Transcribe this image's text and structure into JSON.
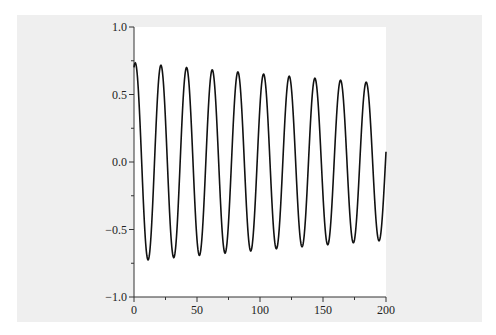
{
  "chart_data": {
    "type": "line",
    "title": "",
    "xlabel": "",
    "ylabel": "",
    "xlim": [
      0,
      200
    ],
    "ylim": [
      -1.0,
      1.0
    ],
    "grid": false,
    "legend": null,
    "x_ticks": [
      "0",
      "50",
      "100",
      "150",
      "200"
    ],
    "x_tick_values": [
      0,
      50,
      100,
      150,
      200
    ],
    "x_minor_ticks": [
      25,
      75,
      125,
      175
    ],
    "y_ticks": [
      "1.0",
      "0.5",
      "0.0",
      "−0.5",
      "−1.0"
    ],
    "y_tick_values": [
      1.0,
      0.5,
      0.0,
      -0.5,
      -1.0
    ],
    "y_minor_ticks": [
      0.75,
      0.25,
      -0.25,
      -0.75
    ],
    "series": [
      {
        "name": "damped oscillation",
        "color": "#111111",
        "model": {
          "amplitude": 0.735,
          "decay": 0.00118,
          "omega": 0.3085,
          "phase_shift": 1.0
        },
        "peaks": [
          {
            "x": 1,
            "y": 0.73
          },
          {
            "x": 21,
            "y": 0.73
          },
          {
            "x": 41,
            "y": 0.72
          },
          {
            "x": 62,
            "y": 0.71
          },
          {
            "x": 82,
            "y": 0.7
          },
          {
            "x": 102,
            "y": 0.68
          },
          {
            "x": 123,
            "y": 0.66
          },
          {
            "x": 143,
            "y": 0.64
          },
          {
            "x": 163,
            "y": 0.62
          },
          {
            "x": 184,
            "y": 0.61
          }
        ],
        "troughs": [
          {
            "x": 11,
            "y": -0.74
          },
          {
            "x": 31,
            "y": -0.72
          },
          {
            "x": 52,
            "y": -0.71
          },
          {
            "x": 72,
            "y": -0.7
          },
          {
            "x": 92,
            "y": -0.68
          },
          {
            "x": 112,
            "y": -0.66
          },
          {
            "x": 133,
            "y": -0.65
          },
          {
            "x": 153,
            "y": -0.63
          },
          {
            "x": 174,
            "y": -0.61
          },
          {
            "x": 194,
            "y": -0.58
          }
        ],
        "start": {
          "x": 0,
          "y": 0.72
        },
        "end": {
          "x": 200,
          "y": 0.07
        }
      }
    ]
  }
}
